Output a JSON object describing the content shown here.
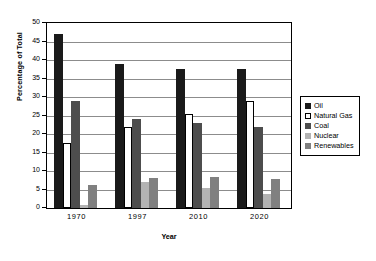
{
  "chart_data": {
    "type": "bar",
    "title": "",
    "xlabel": "Year",
    "ylabel": "Percentage of Total",
    "categories": [
      "1970",
      "1997",
      "2010",
      "2020"
    ],
    "ylim": [
      0,
      50
    ],
    "yticks": [
      0,
      5,
      10,
      15,
      20,
      25,
      30,
      35,
      40,
      45,
      50
    ],
    "grid": true,
    "legend_position": "right",
    "series": [
      {
        "name": "Oil",
        "color": "#1a1a1a",
        "values": [
          47.0,
          38.9,
          37.7,
          37.6
        ]
      },
      {
        "name": "Natural Gas",
        "color": "#ffffff",
        "values": [
          17.5,
          21.9,
          25.3,
          28.8
        ]
      },
      {
        "name": "Coal",
        "color": "#4d4d4d",
        "values": [
          28.9,
          24.0,
          23.1,
          21.8
        ]
      },
      {
        "name": "Nuclear",
        "color": "#b3b3b3",
        "values": [
          0.9,
          7.1,
          5.5,
          3.8
        ]
      },
      {
        "name": "Renewables",
        "color": "#808080",
        "values": [
          6.2,
          8.0,
          8.3,
          7.8
        ]
      }
    ]
  }
}
